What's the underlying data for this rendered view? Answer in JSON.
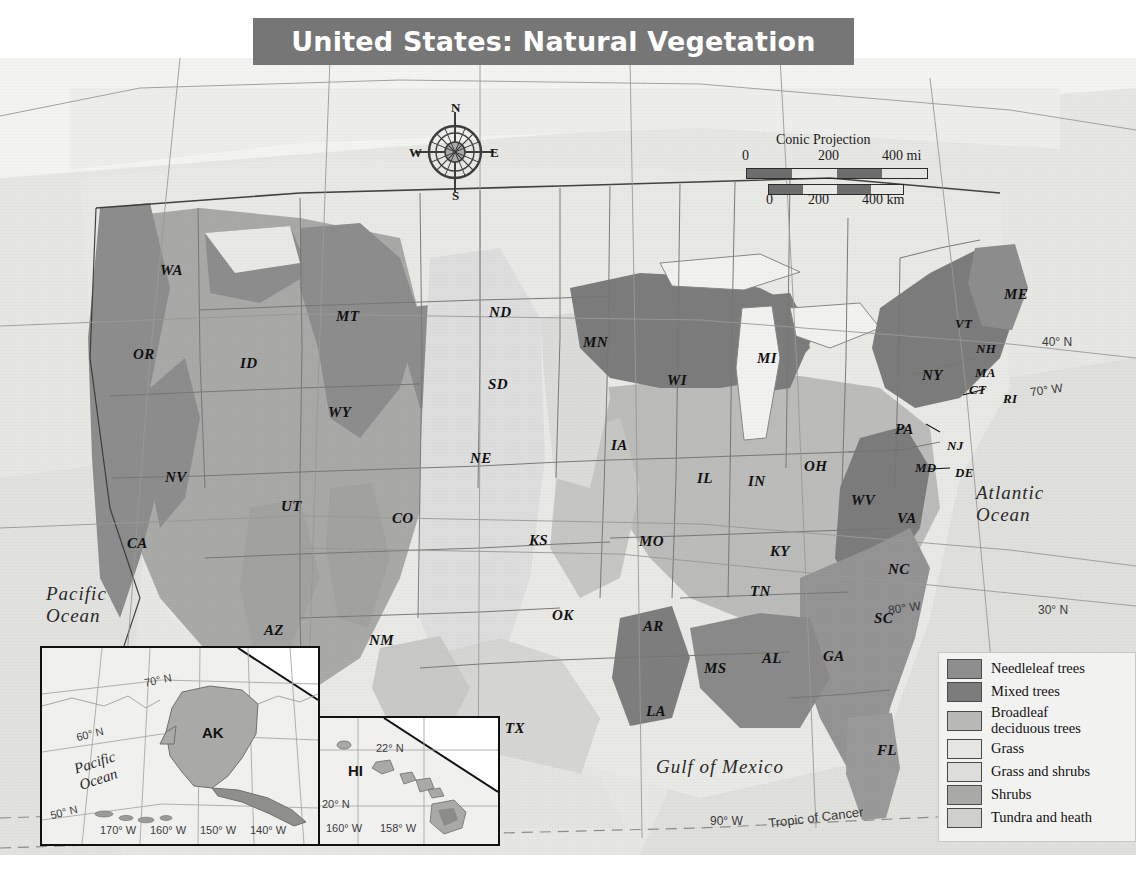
{
  "title": "United States: Natural Vegetation",
  "compass": {
    "n": "N",
    "e": "E",
    "s": "S",
    "w": "W"
  },
  "scale": {
    "projection": "Conic Projection",
    "miles": [
      "0",
      "200",
      "400 mi"
    ],
    "km": [
      "0",
      "200",
      "400 km"
    ]
  },
  "oceans": [
    {
      "name": "Pacific Ocean",
      "line1": "Pacific",
      "line2": "Ocean"
    },
    {
      "name": "Atlantic Ocean",
      "line1": "Atlantic",
      "line2": "Ocean"
    },
    {
      "name": "Gulf of Mexico",
      "line1": "Gulf of Mexico",
      "line2": ""
    }
  ],
  "graticule": [
    {
      "label": "40° N"
    },
    {
      "label": "30° N"
    },
    {
      "label": "70° W"
    },
    {
      "label": "80° W"
    },
    {
      "label": "90° W"
    },
    {
      "label": "Tropic of Cancer"
    }
  ],
  "states": [
    {
      "abbr": "WA",
      "x": 160,
      "y": 204
    },
    {
      "abbr": "OR",
      "x": 133,
      "y": 288
    },
    {
      "abbr": "ID",
      "x": 240,
      "y": 297
    },
    {
      "abbr": "MT",
      "x": 336,
      "y": 250
    },
    {
      "abbr": "WY",
      "x": 328,
      "y": 346
    },
    {
      "abbr": "ND",
      "x": 489,
      "y": 246
    },
    {
      "abbr": "SD",
      "x": 488,
      "y": 318
    },
    {
      "abbr": "NE",
      "x": 470,
      "y": 392
    },
    {
      "abbr": "MN",
      "x": 583,
      "y": 276
    },
    {
      "abbr": "WI",
      "x": 667,
      "y": 314
    },
    {
      "abbr": "MI",
      "x": 757,
      "y": 292
    },
    {
      "abbr": "IA",
      "x": 611,
      "y": 379
    },
    {
      "abbr": "IL",
      "x": 697,
      "y": 412
    },
    {
      "abbr": "IN",
      "x": 748,
      "y": 415
    },
    {
      "abbr": "OH",
      "x": 804,
      "y": 400
    },
    {
      "abbr": "NV",
      "x": 165,
      "y": 411
    },
    {
      "abbr": "UT",
      "x": 281,
      "y": 440
    },
    {
      "abbr": "CO",
      "x": 392,
      "y": 452
    },
    {
      "abbr": "CA",
      "x": 127,
      "y": 477
    },
    {
      "abbr": "AZ",
      "x": 264,
      "y": 564
    },
    {
      "abbr": "NM",
      "x": 369,
      "y": 574
    },
    {
      "abbr": "KS",
      "x": 529,
      "y": 474
    },
    {
      "abbr": "MO",
      "x": 639,
      "y": 475
    },
    {
      "abbr": "OK",
      "x": 552,
      "y": 549
    },
    {
      "abbr": "AR",
      "x": 643,
      "y": 560
    },
    {
      "abbr": "TX",
      "x": 505,
      "y": 662
    },
    {
      "abbr": "LA",
      "x": 646,
      "y": 645
    },
    {
      "abbr": "MS",
      "x": 704,
      "y": 602
    },
    {
      "abbr": "AL",
      "x": 762,
      "y": 592
    },
    {
      "abbr": "TN",
      "x": 750,
      "y": 525
    },
    {
      "abbr": "KY",
      "x": 770,
      "y": 485
    },
    {
      "abbr": "GA",
      "x": 823,
      "y": 590
    },
    {
      "abbr": "FL",
      "x": 877,
      "y": 684
    },
    {
      "abbr": "SC",
      "x": 874,
      "y": 552
    },
    {
      "abbr": "NC",
      "x": 888,
      "y": 503
    },
    {
      "abbr": "VA",
      "x": 897,
      "y": 452
    },
    {
      "abbr": "WV",
      "x": 851,
      "y": 434
    },
    {
      "abbr": "MD",
      "x": 915,
      "y": 402
    },
    {
      "abbr": "DE",
      "x": 955,
      "y": 407
    },
    {
      "abbr": "NJ",
      "x": 947,
      "y": 380
    },
    {
      "abbr": "PA",
      "x": 895,
      "y": 363
    },
    {
      "abbr": "NY",
      "x": 922,
      "y": 309
    },
    {
      "abbr": "VT",
      "x": 955,
      "y": 258
    },
    {
      "abbr": "NH",
      "x": 976,
      "y": 283
    },
    {
      "abbr": "MA",
      "x": 975,
      "y": 307
    },
    {
      "abbr": "CT",
      "x": 969,
      "y": 324
    },
    {
      "abbr": "RI",
      "x": 1003,
      "y": 333
    },
    {
      "abbr": "ME",
      "x": 1004,
      "y": 228
    }
  ],
  "insets": {
    "alaska": {
      "label": "AK",
      "ocean_line1": "Pacific",
      "ocean_line2": "Ocean",
      "graticule": [
        "70° N",
        "60° N",
        "50° N",
        "170° W",
        "160° W",
        "150° W",
        "140° W"
      ]
    },
    "hawaii": {
      "label": "HI",
      "graticule": [
        "22° N",
        "20° N",
        "160° W",
        "158° W"
      ]
    }
  },
  "legend": {
    "items": [
      {
        "label": "Needleleaf trees",
        "color": "#8e8e8e"
      },
      {
        "label": "Mixed trees",
        "color": "#7c7c7c"
      },
      {
        "label": "Broadleaf\ndeciduous trees",
        "color": "#b9b9b7"
      },
      {
        "label": "Grass",
        "color": "#e6e6e3"
      },
      {
        "label": "Grass and shrubs",
        "color": "#dddddb"
      },
      {
        "label": "Shrubs",
        "color": "#a9a9a7"
      },
      {
        "label": "Tundra and heath",
        "color": "#cfcfcc"
      }
    ]
  },
  "colors": {
    "title_bar": "#767676",
    "map_background": "#e8e8e6",
    "ocean": "#e3e3e0",
    "border": "#6a6a6a"
  }
}
